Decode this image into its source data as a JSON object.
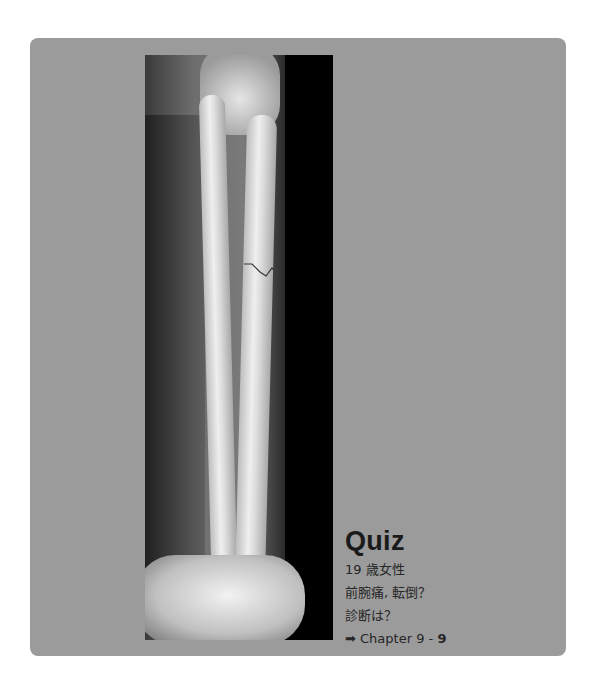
{
  "quiz": {
    "title": "Quiz",
    "lines": [
      "19 歳女性",
      "前腕痛, 転倒？",
      "診断は？"
    ],
    "reference": {
      "arrow_icon": "right-arrow-icon",
      "arrow": "➡",
      "prefix": "Chapter 9 - ",
      "number": "9"
    }
  },
  "image": {
    "description": "Lateral forearm radiograph showing radius and ulna with a fracture line in the proximal third"
  },
  "colors": {
    "card": "#9b9b9b",
    "background": "#ffffff",
    "text": "#1a1a1a"
  }
}
